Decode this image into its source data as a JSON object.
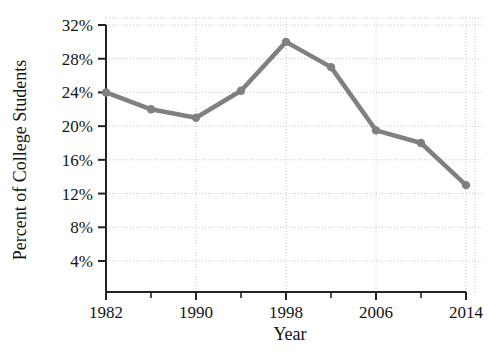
{
  "chart_data": {
    "type": "line",
    "title": "",
    "xlabel": "Year",
    "ylabel": "Percent of College Students",
    "x": [
      1982,
      1986,
      1990,
      1994,
      1998,
      2002,
      2006,
      2010,
      2014
    ],
    "values": [
      24,
      22,
      21,
      24.2,
      30,
      27,
      19.5,
      18,
      13
    ],
    "series": [
      {
        "name": "Percent of College Students",
        "values": [
          24,
          22,
          21,
          24.2,
          30,
          27,
          19.5,
          18,
          13
        ]
      }
    ],
    "xlim": [
      1982,
      2014
    ],
    "ylim": [
      0,
      32
    ],
    "x_tick_labels": [
      "1982",
      "1990",
      "1998",
      "2006",
      "2014"
    ],
    "x_tick_values": [
      1982,
      1990,
      1998,
      2006,
      2014
    ],
    "x_minor_tick_values": [
      1986,
      1994,
      2002,
      2010
    ],
    "y_tick_labels": [
      "32%",
      "28%",
      "24%",
      "20%",
      "16%",
      "12%",
      "8%",
      "4%"
    ],
    "y_tick_values": [
      32,
      28,
      24,
      20,
      16,
      12,
      8,
      4
    ],
    "grid": true,
    "grid_style": "dotted",
    "legend": "none",
    "colors": {
      "line": "#808080",
      "marker": "#808080",
      "grid": "#c9c9c9",
      "axis": "#232323",
      "text": "#141414",
      "background": "#ffffff"
    }
  }
}
